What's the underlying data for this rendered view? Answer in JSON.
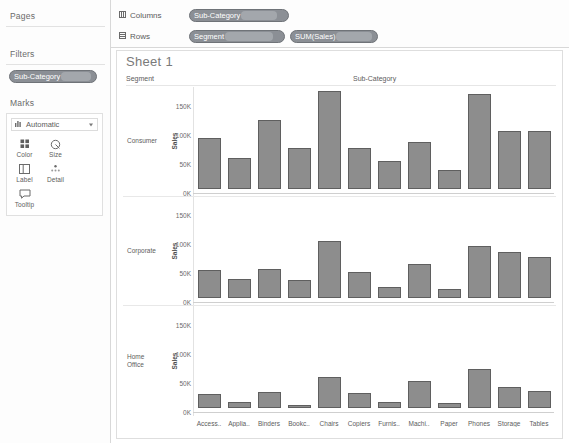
{
  "sidebar": {
    "pages": {
      "title": "Pages"
    },
    "filters": {
      "title": "Filters",
      "pill": "Sub-Category"
    },
    "marks": {
      "title": "Marks",
      "mark_type": "Automatic",
      "buttons": [
        {
          "label": "Color",
          "icon": "color-squares-icon"
        },
        {
          "label": "Size",
          "icon": "size-circle-icon"
        },
        {
          "label": "Label",
          "icon": "label-box-icon"
        },
        {
          "label": "Detail",
          "icon": "detail-dots-icon"
        },
        {
          "label": "Tooltip",
          "icon": "tooltip-bubble-icon"
        }
      ]
    }
  },
  "shelves": {
    "columns_label": "Columns",
    "rows_label": "Rows",
    "columns_pills": [
      "Sub-Category"
    ],
    "rows_pills": [
      "Segment",
      "SUM(Sales)"
    ]
  },
  "worksheet": {
    "title": "Sheet 1",
    "row_header_label": "Segment",
    "column_header_label": "Sub-Category"
  },
  "chart_data": {
    "type": "bar",
    "title": "Sheet 1",
    "xlabel": "Sub-Category",
    "ylabel": "Sales",
    "ylim": [
      0,
      175
    ],
    "yticks": [
      0,
      50,
      100,
      150
    ],
    "ytick_labels": [
      "0K",
      "50K",
      "100K",
      "150K"
    ],
    "grid": false,
    "legend": "none",
    "categories": [
      "Access..",
      "Applia..",
      "Binders",
      "Bookc..",
      "Chairs",
      "Copiers",
      "Furnis..",
      "Machi..",
      "Paper",
      "Phones",
      "Storage",
      "Tables"
    ],
    "panel_label": "Segment",
    "panels": [
      {
        "name": "Consumer",
        "axis_label": "Sales",
        "values": [
          88,
          52,
          118,
          70,
          168,
          70,
          48,
          80,
          33,
          163,
          100,
          100
        ]
      },
      {
        "name": "Corporate",
        "axis_label": "Sales",
        "values": [
          48,
          34,
          50,
          31,
          98,
          45,
          19,
          59,
          16,
          90,
          80,
          71
        ]
      },
      {
        "name": "Home Office",
        "axis_label": "Sales",
        "values": [
          24,
          11,
          28,
          6,
          53,
          26,
          10,
          46,
          9,
          67,
          37,
          29
        ]
      }
    ],
    "bar_color": "#8d8d8d",
    "bar_border_color": "#5f5f5f"
  }
}
